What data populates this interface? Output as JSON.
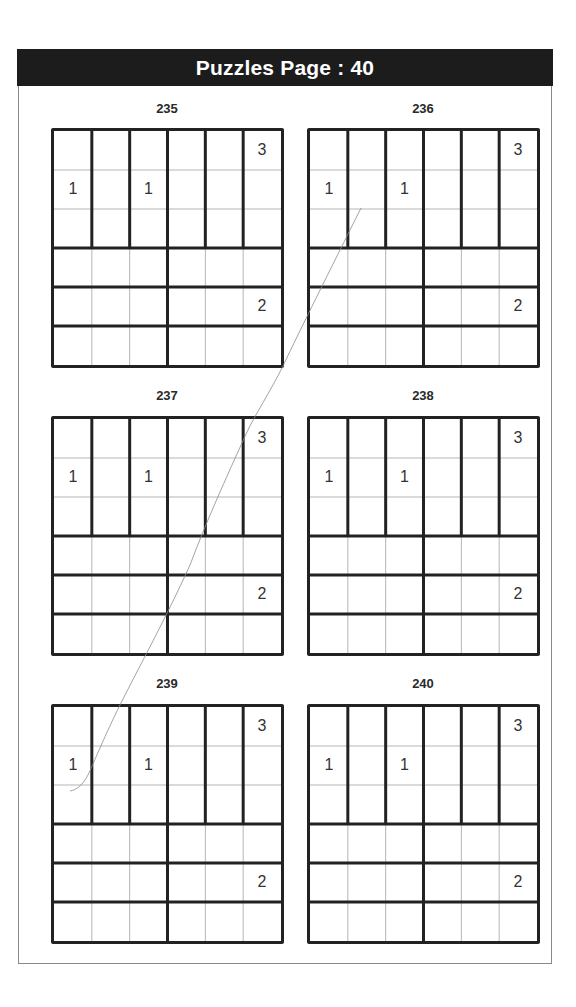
{
  "header": {
    "title": "Puzzles Page :  40"
  },
  "colors": {
    "header_bg": "#1c1c1c",
    "grid_line": "#222222",
    "thin_line": "#b5b5b5"
  },
  "puzzles": [
    {
      "number": "235",
      "clues": [
        {
          "row": 0,
          "col": 5,
          "value": "3"
        },
        {
          "row": 1,
          "col": 0,
          "value": "1"
        },
        {
          "row": 1,
          "col": 2,
          "value": "1"
        },
        {
          "row": 4,
          "col": 5,
          "value": "2"
        }
      ]
    },
    {
      "number": "236",
      "clues": [
        {
          "row": 0,
          "col": 5,
          "value": "3"
        },
        {
          "row": 1,
          "col": 0,
          "value": "1"
        },
        {
          "row": 1,
          "col": 2,
          "value": "1"
        },
        {
          "row": 4,
          "col": 5,
          "value": "2"
        }
      ]
    },
    {
      "number": "237",
      "clues": [
        {
          "row": 0,
          "col": 5,
          "value": "3"
        },
        {
          "row": 1,
          "col": 0,
          "value": "1"
        },
        {
          "row": 1,
          "col": 2,
          "value": "1"
        },
        {
          "row": 4,
          "col": 5,
          "value": "2"
        }
      ]
    },
    {
      "number": "238",
      "clues": [
        {
          "row": 0,
          "col": 5,
          "value": "3"
        },
        {
          "row": 1,
          "col": 0,
          "value": "1"
        },
        {
          "row": 1,
          "col": 2,
          "value": "1"
        },
        {
          "row": 4,
          "col": 5,
          "value": "2"
        }
      ]
    },
    {
      "number": "239",
      "clues": [
        {
          "row": 0,
          "col": 5,
          "value": "3"
        },
        {
          "row": 1,
          "col": 0,
          "value": "1"
        },
        {
          "row": 1,
          "col": 2,
          "value": "1"
        },
        {
          "row": 4,
          "col": 5,
          "value": "2"
        }
      ]
    },
    {
      "number": "240",
      "clues": [
        {
          "row": 0,
          "col": 5,
          "value": "3"
        },
        {
          "row": 1,
          "col": 0,
          "value": "1"
        },
        {
          "row": 1,
          "col": 2,
          "value": "1"
        },
        {
          "row": 4,
          "col": 5,
          "value": "2"
        }
      ]
    }
  ],
  "grid_layout": {
    "size": 6,
    "regions_description": "Top 3 rows: six vertical 1x3 regions; bottom 3 rows: each row split into two horizontal 3x1 regions"
  }
}
